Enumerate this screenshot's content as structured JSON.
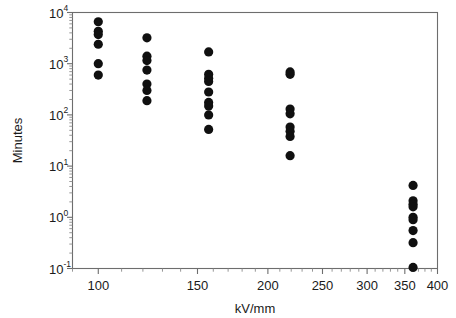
{
  "chart_data": {
    "type": "scatter",
    "title": "",
    "xlabel": "kV/mm",
    "ylabel": "Minutes",
    "xscale": "log",
    "yscale": "log",
    "xlim": [
      90,
      400
    ],
    "ylim": [
      0.1,
      10000
    ],
    "grid": false,
    "legend": null,
    "x_ticks": [
      100,
      150,
      200,
      250,
      300,
      350,
      400
    ],
    "x_tick_labels": [
      "100",
      "150",
      "200",
      "250",
      "300",
      "350",
      "400"
    ],
    "y_ticks": [
      0.1,
      1,
      10,
      100,
      1000,
      10000
    ],
    "y_tick_labels": [
      "10-1",
      "100",
      "101",
      "102",
      "103",
      "104"
    ],
    "y_tick_mantissa": [
      "10",
      "10",
      "10",
      "10",
      "10",
      "10"
    ],
    "y_tick_exponent": [
      "-1",
      "0",
      "1",
      "2",
      "3",
      "4"
    ],
    "marker": "filled-circle",
    "marker_color": "#101010",
    "marker_size": 4.6,
    "series": [
      {
        "name": "breakdown-times",
        "points": [
          {
            "x": 100,
            "y": 6600
          },
          {
            "x": 100,
            "y": 4300
          },
          {
            "x": 100,
            "y": 3700
          },
          {
            "x": 100,
            "y": 2400
          },
          {
            "x": 100,
            "y": 1000
          },
          {
            "x": 100,
            "y": 600
          },
          {
            "x": 122,
            "y": 3200
          },
          {
            "x": 122,
            "y": 1400
          },
          {
            "x": 122,
            "y": 1150
          },
          {
            "x": 122,
            "y": 750
          },
          {
            "x": 122,
            "y": 400
          },
          {
            "x": 122,
            "y": 300
          },
          {
            "x": 122,
            "y": 190
          },
          {
            "x": 157,
            "y": 1700
          },
          {
            "x": 157,
            "y": 620
          },
          {
            "x": 157,
            "y": 520
          },
          {
            "x": 157,
            "y": 450
          },
          {
            "x": 157,
            "y": 280
          },
          {
            "x": 157,
            "y": 175
          },
          {
            "x": 157,
            "y": 150
          },
          {
            "x": 157,
            "y": 100
          },
          {
            "x": 157,
            "y": 52
          },
          {
            "x": 219,
            "y": 690
          },
          {
            "x": 219,
            "y": 620
          },
          {
            "x": 219,
            "y": 130
          },
          {
            "x": 219,
            "y": 105
          },
          {
            "x": 219,
            "y": 58
          },
          {
            "x": 219,
            "y": 48
          },
          {
            "x": 219,
            "y": 38
          },
          {
            "x": 219,
            "y": 16
          },
          {
            "x": 362,
            "y": 4.2
          },
          {
            "x": 362,
            "y": 2.1
          },
          {
            "x": 362,
            "y": 1.8
          },
          {
            "x": 362,
            "y": 1.6
          },
          {
            "x": 362,
            "y": 1.0
          },
          {
            "x": 362,
            "y": 0.9
          },
          {
            "x": 362,
            "y": 0.55
          },
          {
            "x": 362,
            "y": 0.32
          },
          {
            "x": 362,
            "y": 0.105
          }
        ]
      }
    ]
  }
}
